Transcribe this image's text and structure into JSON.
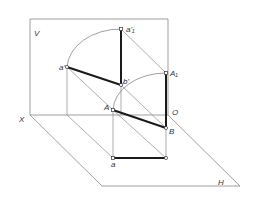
{
  "diagram": {
    "type": "descriptive-geometry projection (line segment rotation)",
    "planes": {
      "vertical": {
        "label": "V"
      },
      "horizontal": {
        "label": "H"
      }
    },
    "axis": {
      "x_label": "X",
      "origin_label": "O"
    },
    "points": {
      "a1_prime": {
        "label": "a'₁"
      },
      "a_prime": {
        "label": "a'"
      },
      "b_prime": {
        "label": "b'"
      },
      "A1": {
        "label": "A₁"
      },
      "A": {
        "label": "A"
      },
      "B": {
        "label": "B"
      },
      "a": {
        "label": "a"
      }
    },
    "colors": {
      "thin_line": "#666666",
      "thick_line": "#1a1a1a",
      "background": "#ffffff"
    }
  }
}
